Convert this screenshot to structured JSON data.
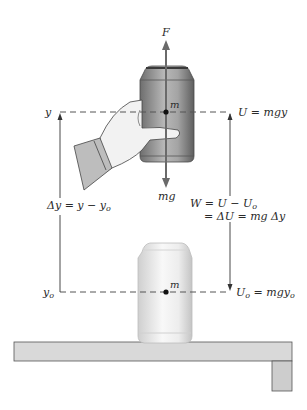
{
  "diagram": {
    "colors": {
      "line": "#333333",
      "arrow": "#6a6a6a",
      "dash": "#555555",
      "upper_can_dark": "#6e6e6e",
      "upper_can_light": "#b8b8b8",
      "lower_can_dark": "#cfcfcf",
      "lower_can_light": "#f6f6f6",
      "shelf_fill": "#d9d9d9",
      "shelf_leg_fill": "#cdcdcd",
      "hand_fill": "#f2f2f2",
      "sleeve_fill": "#bdbdbd"
    },
    "labels": {
      "force_up": "F",
      "force_down": "mg",
      "mass_upper": "m",
      "mass_lower": "m",
      "y_upper": "y",
      "y_lower_base": "y",
      "y_lower_sub": "o",
      "U_upper": "U = mgy",
      "U_lower_base": "U",
      "U_lower_sub": "o",
      "U_lower_rest": " = mgy",
      "U_lower_sub2": "o",
      "delta_y": "Δy = y − y",
      "delta_y_sub": "o",
      "work_line1": "W = U − U",
      "work_line1_sub": "o",
      "work_line2": "= ΔU = mg Δy"
    },
    "elements": [
      {
        "name": "upper-can",
        "description": "Can held by hand at height y"
      },
      {
        "name": "lower-can",
        "description": "Can resting on shelf at height y0"
      },
      {
        "name": "shelf",
        "description": "Horizontal shelf with support leg"
      },
      {
        "name": "hand",
        "description": "Hand lifting the can"
      }
    ]
  }
}
